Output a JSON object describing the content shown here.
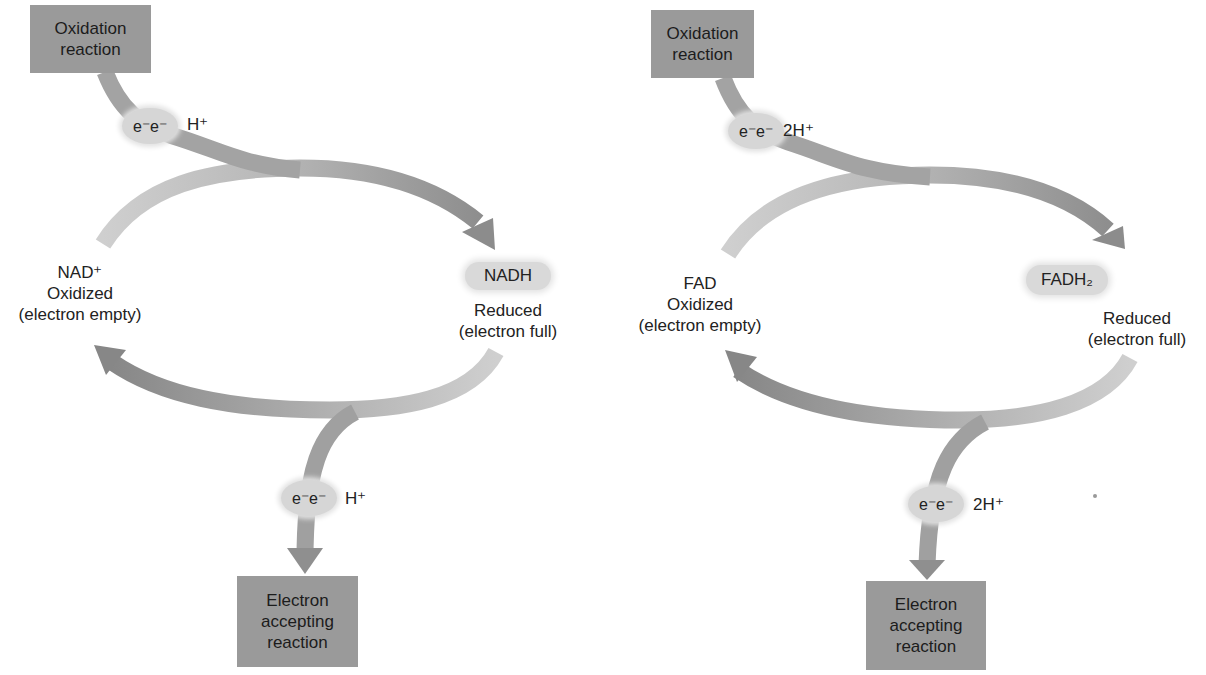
{
  "diagrams": [
    {
      "name": "NAD cycle",
      "top_box": "Oxidation reaction",
      "top_box_lines": [
        "Oxidation",
        "reaction"
      ],
      "top_electrons": "e⁻e⁻",
      "top_proton": "H⁺",
      "oxidized": {
        "name": "NAD⁺",
        "state": "Oxidized",
        "note": "(electron empty)"
      },
      "reduced": {
        "name": "NADH",
        "state": "Reduced",
        "note": "(electron full)"
      },
      "bottom_electrons": "e⁻e⁻",
      "bottom_proton": "H⁺",
      "bottom_box_lines": [
        "Electron",
        "accepting",
        "reaction"
      ]
    },
    {
      "name": "FAD cycle",
      "top_box": "Oxidation reaction",
      "top_box_lines": [
        "Oxidation",
        "reaction"
      ],
      "top_electrons": "e⁻e⁻",
      "top_proton": "2H⁺",
      "oxidized": {
        "name": "FAD",
        "state": "Oxidized",
        "note": "(electron empty)"
      },
      "reduced": {
        "name": "FADH₂",
        "state": "Reduced",
        "note": "(electron full)"
      },
      "bottom_electrons": "e⁻e⁻",
      "bottom_proton": "2H⁺",
      "bottom_box_lines": [
        "Electron",
        "accepting",
        "reaction"
      ]
    }
  ],
  "colors": {
    "box": "#9a9a9a",
    "arrow_dark": "#8a8a8a",
    "arrow_light": "#c4c4c4",
    "bubble": "#d6d6d6"
  }
}
